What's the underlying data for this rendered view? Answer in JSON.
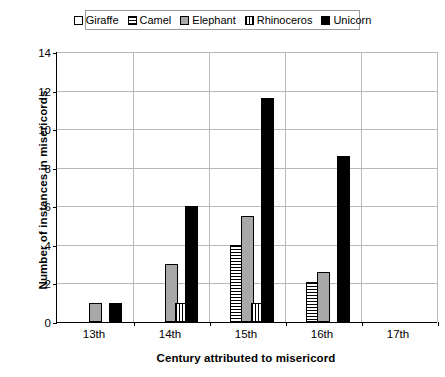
{
  "chart_data": {
    "type": "bar",
    "title": "",
    "xlabel": "Century attributed to misericord",
    "ylabel": "Number of instances in misericords",
    "categories": [
      "13th",
      "14th",
      "15th",
      "16th",
      "17th"
    ],
    "ylim": [
      0,
      14
    ],
    "yticks": [
      0,
      2,
      4,
      6,
      8,
      10,
      12,
      14
    ],
    "grid": true,
    "legend_position": "top",
    "series": [
      {
        "name": "Giraffe",
        "pattern": "empty",
        "color": "#ffffff",
        "values": [
          0,
          0,
          0,
          0,
          0
        ]
      },
      {
        "name": "Camel",
        "pattern": "horizontal-stripes",
        "color": "#ffffff",
        "values": [
          0,
          0,
          4,
          2.1,
          0
        ]
      },
      {
        "name": "Elephant",
        "pattern": "solid-gray",
        "color": "#a8a8a8",
        "values": [
          1,
          3,
          5.5,
          2.6,
          0
        ]
      },
      {
        "name": "Rhinoceros",
        "pattern": "vertical-stripes",
        "color": "#ffffff",
        "values": [
          0,
          1,
          1,
          0,
          0
        ]
      },
      {
        "name": "Unicorn",
        "pattern": "solid-black",
        "color": "#000000",
        "values": [
          1,
          6,
          11.6,
          8.6,
          0
        ]
      }
    ]
  }
}
